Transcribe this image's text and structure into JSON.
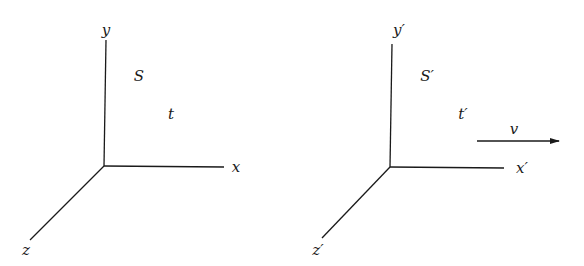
{
  "diagram": {
    "frames": [
      {
        "id": "S",
        "frame_label": "S",
        "time_label": "t",
        "origin": [
          104,
          166
        ],
        "axes": {
          "x": {
            "label": "x",
            "end": [
              224,
              167
            ],
            "label_pos": [
              236,
              167
            ]
          },
          "y": {
            "label": "y",
            "end": [
              106,
              40
            ],
            "label_pos": [
              106,
              30
            ]
          },
          "z": {
            "label": "z",
            "end": [
              30,
              240
            ],
            "label_pos": [
              26,
              250
            ]
          }
        },
        "frame_label_pos": [
          139,
          76
        ],
        "time_label_pos": [
          171,
          114
        ]
      },
      {
        "id": "S-prime",
        "frame_label": "S′",
        "time_label": "t′",
        "origin": [
          390,
          167
        ],
        "axes": {
          "x": {
            "label": "x′",
            "end": [
              504,
              168
            ],
            "label_pos": [
              522,
              168
            ]
          },
          "y": {
            "label": "y′",
            "end": [
              392,
              44
            ],
            "label_pos": [
              399,
              30
            ]
          },
          "z": {
            "label": "z′",
            "end": [
              322,
              238
            ],
            "label_pos": [
              318,
              250
            ]
          }
        },
        "frame_label_pos": [
          427,
          76
        ],
        "time_label_pos": [
          463,
          114
        ]
      }
    ],
    "velocity": {
      "label": "v",
      "arrow_start": [
        477,
        141
      ],
      "arrow_end": [
        559,
        141
      ],
      "label_pos": [
        514,
        129
      ]
    },
    "colors": {
      "ink": "#1a1a1a",
      "background": "#ffffff"
    }
  }
}
